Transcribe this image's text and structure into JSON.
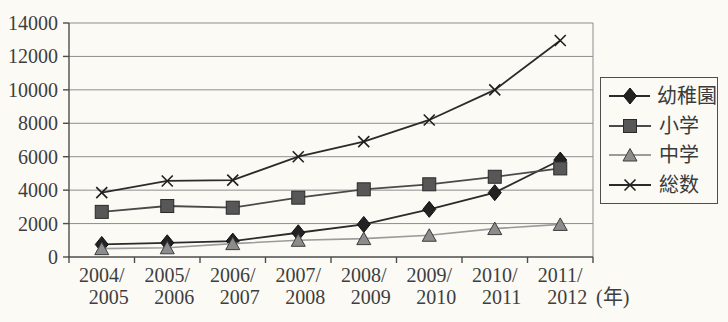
{
  "colors": {
    "background": "#fbfaf5",
    "text": "#3e3e3e",
    "grid": "#8d8d8d",
    "axis": "#4c4c4c",
    "legend_border": "#4e4e4e"
  },
  "chart_data": {
    "type": "line",
    "title": "",
    "categories": [
      "2004/2005",
      "2005/2006",
      "2006/2007",
      "2007/2008",
      "2008/2009",
      "2009/2010",
      "2010/2011",
      "2011/2012"
    ],
    "x_unit_label": "(年)",
    "xlabel": "",
    "ylabel": "",
    "ylim": [
      0,
      14000
    ],
    "y_tick_step": 2000,
    "y_tick_labels": [
      "0",
      "2000",
      "4000",
      "6000",
      "8000",
      "10000",
      "12000",
      "14000"
    ],
    "grid": true,
    "legend_position": "right",
    "series": [
      {
        "name": "幼稚園",
        "semantic": "kindergarten",
        "marker": "diamond",
        "line_color": "#2b2b2b",
        "fill": "#222222",
        "edge": "#0f0f0f",
        "values": [
          750,
          850,
          950,
          1450,
          1950,
          2850,
          3850,
          5800
        ]
      },
      {
        "name": "小学",
        "semantic": "elementary-school",
        "marker": "square",
        "line_color": "#4a4a4a",
        "fill": "#575757",
        "edge": "#2a2a2a",
        "values": [
          2700,
          3050,
          2950,
          3550,
          4050,
          4350,
          4800,
          5300
        ]
      },
      {
        "name": "中学",
        "semantic": "junior-high-school",
        "marker": "triangle",
        "line_color": "#9b9b9b",
        "fill": "#8c8c8c",
        "edge": "#3c3c3c",
        "values": [
          500,
          550,
          800,
          1000,
          1100,
          1300,
          1700,
          1950
        ]
      },
      {
        "name": "総数",
        "semantic": "total",
        "marker": "x",
        "line_color": "#2b2b2b",
        "fill": "#1e1e1e",
        "edge": "#1e1e1e",
        "values": [
          3850,
          4550,
          4600,
          6000,
          6900,
          8200,
          10000,
          12950
        ]
      }
    ]
  }
}
